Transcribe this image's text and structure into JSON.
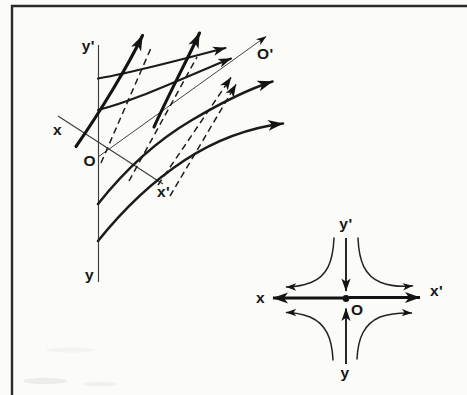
{
  "colors": {
    "background": "#fbfbf8",
    "ink": "#1b1b1b",
    "axis": "#3d3d3d",
    "frame": "#2a2a2a"
  },
  "left_diagram": {
    "description": "saddle phase portrait in oblique coordinates",
    "labels": {
      "y_prime": "y'",
      "y": "y",
      "x": "x",
      "x_prime": "x'",
      "origin": "O",
      "origin_prime": "O'"
    }
  },
  "right_diagram": {
    "description": "saddle phase portrait in normal coordinates",
    "labels": {
      "y_prime": "y'",
      "y": "y",
      "x": "x",
      "x_prime": "x'",
      "origin": "O"
    }
  }
}
